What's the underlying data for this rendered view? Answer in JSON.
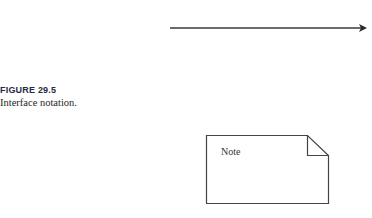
{
  "figure": {
    "label": "FIGURE 29.5",
    "caption": "Interface notation."
  },
  "diagram": {
    "arrow": {
      "type": "directed-association",
      "x1": 170,
      "y1": 28,
      "x2": 366,
      "y2": 28
    },
    "note": {
      "text": "Note",
      "shape": "folded-corner-rectangle"
    }
  },
  "colors": {
    "stroke": "#444444",
    "text": "#231f20"
  }
}
